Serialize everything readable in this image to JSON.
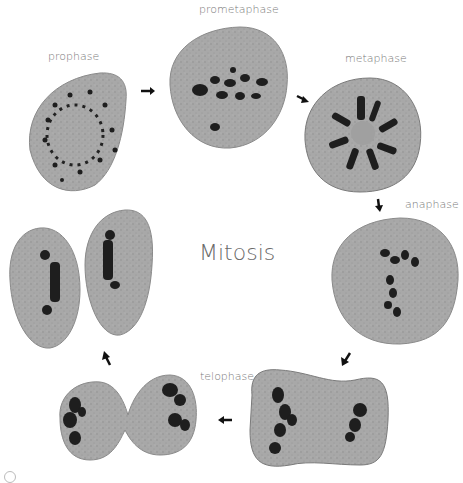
{
  "title": "Mitosis",
  "phases": [
    {
      "label": "prophase"
    },
    {
      "label": "prometaphase"
    },
    {
      "label": "metaphase"
    },
    {
      "label": "anaphase"
    },
    {
      "label": "telophase"
    },
    {
      "label": "cytokinesis"
    }
  ],
  "colors": {
    "background": "#ffffff",
    "cell_fill": "#a6a6a6",
    "cell_edge": "#8a8a8a",
    "chromosome": "#1e1e1e",
    "label_text": "#7a7a7a",
    "arrow": "#111111"
  },
  "arrows": [
    {
      "from": "prophase",
      "to": "prometaphase",
      "direction": "right"
    },
    {
      "from": "prometaphase",
      "to": "metaphase",
      "direction": "down-right"
    },
    {
      "from": "metaphase",
      "to": "anaphase",
      "direction": "down"
    },
    {
      "from": "anaphase",
      "to": "late-anaphase",
      "direction": "down-left"
    },
    {
      "from": "late-anaphase",
      "to": "telophase",
      "direction": "left"
    },
    {
      "from": "telophase",
      "to": "cytokinesis",
      "direction": "up-left"
    }
  ]
}
